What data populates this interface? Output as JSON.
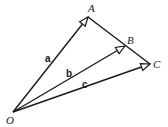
{
  "diagram": {
    "title": "",
    "origin": {
      "label": "O",
      "x": 13,
      "y": 112
    },
    "points": [
      {
        "id": "A",
        "label": "A",
        "x": 88,
        "y": 17,
        "label_x": 88,
        "label_y": 12
      },
      {
        "id": "B",
        "label": "B",
        "x": 125,
        "y": 46,
        "label_x": 127,
        "label_y": 44
      },
      {
        "id": "C",
        "label": "C",
        "x": 150,
        "y": 64,
        "label_x": 153,
        "label_y": 68
      }
    ],
    "vectors": [
      {
        "name": "a",
        "from": "O",
        "to": "A",
        "label": "a",
        "label_x": 45,
        "label_y": 62
      },
      {
        "name": "b",
        "from": "O",
        "to": "B",
        "label": "b",
        "label_x": 66,
        "label_y": 77
      },
      {
        "name": "c",
        "from": "O",
        "to": "C",
        "label": "c",
        "label_x": 82,
        "label_y": 88
      }
    ],
    "segments": [
      {
        "from": "A",
        "to": "C",
        "through": "B"
      }
    ],
    "stroke_color": "#1a1a1a",
    "arrow_fill": "#ffffff"
  }
}
